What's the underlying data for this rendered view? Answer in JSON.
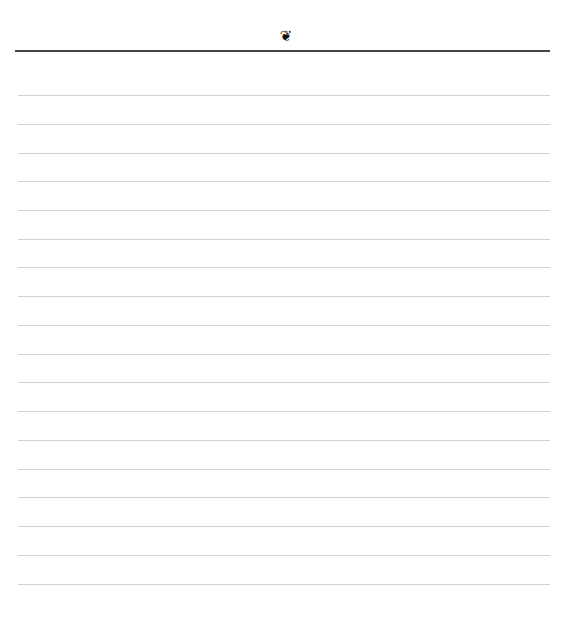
{
  "page": {
    "type": "lined-notebook-page",
    "ornament": {
      "icon": "floral-heart-ornament-icon",
      "glyph": "❦"
    },
    "header_rule_color": "#444444",
    "rule_color": "#d0d0d0",
    "rules": [
      {
        "y": 95
      },
      {
        "y": 124
      },
      {
        "y": 153
      },
      {
        "y": 181
      },
      {
        "y": 210
      },
      {
        "y": 239
      },
      {
        "y": 267
      },
      {
        "y": 296
      },
      {
        "y": 325
      },
      {
        "y": 354
      },
      {
        "y": 382
      },
      {
        "y": 411
      },
      {
        "y": 440
      },
      {
        "y": 469
      },
      {
        "y": 497
      },
      {
        "y": 526
      },
      {
        "y": 555
      },
      {
        "y": 584
      }
    ]
  }
}
